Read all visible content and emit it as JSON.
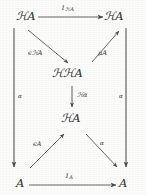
{
  "figure": {
    "kind": "commutative-diagram",
    "ink_color": "#3a3a3a",
    "background_color": "#fdfdfc",
    "width": 146,
    "height": 195
  },
  "nodes": {
    "top_left": {
      "script_h": "ℋ",
      "object": "A",
      "label": "ℋA"
    },
    "top_right": {
      "script_h": "ℋ",
      "object": "A",
      "label": "ℋA"
    },
    "center_upper": {
      "script_h": "ℋℋ",
      "object": "A",
      "label": "ℋℋA"
    },
    "center_lower": {
      "script_h": "ℋ",
      "object": "A",
      "label": "ℋA"
    },
    "bottom_left": {
      "script_h": "",
      "object": "A",
      "label": "A"
    },
    "bottom_right": {
      "script_h": "",
      "object": "A",
      "label": "A"
    }
  },
  "arrows": {
    "top": {
      "name": "identity-on-HA",
      "label_main": "1",
      "label_sub": "ℋA",
      "from": "top_left",
      "to": "top_right",
      "direction": "right"
    },
    "upper_left_diagonal": {
      "name": "epsilon-HA",
      "label_main": "ϵℋA",
      "from": "top_left",
      "to": "center_upper",
      "direction": "down-right"
    },
    "upper_right_diagonal": {
      "name": "mu-A",
      "label_main": "μA",
      "from": "center_upper",
      "to": "top_right",
      "direction": "up-right"
    },
    "center_vertical": {
      "name": "H-alpha",
      "label_main": "ℋα",
      "from": "center_upper",
      "to": "center_lower",
      "direction": "down"
    },
    "lower_left_diagonal": {
      "name": "epsilon-A",
      "label_main": "ϵA",
      "from": "bottom_left",
      "to": "center_lower",
      "direction": "up-right"
    },
    "lower_right_diagonal": {
      "name": "alpha-right",
      "label_main": "α",
      "from": "center_lower",
      "to": "bottom_right",
      "direction": "down-right"
    },
    "left_vertical": {
      "name": "alpha-left",
      "label_main": "α",
      "from": "top_left",
      "to": "bottom_left",
      "direction": "down"
    },
    "right_vertical": {
      "name": "alpha-right-outer",
      "label_main": "α",
      "from": "top_right",
      "to": "bottom_right",
      "direction": "down"
    },
    "bottom": {
      "name": "identity-on-A",
      "label_main": "1",
      "label_sub": "A",
      "from": "bottom_left",
      "to": "bottom_right",
      "direction": "right"
    }
  }
}
